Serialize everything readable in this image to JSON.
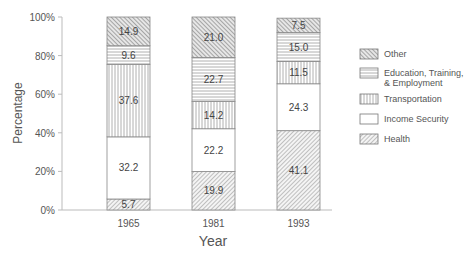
{
  "chart_data": {
    "type": "bar",
    "stacked": true,
    "title": "",
    "xlabel": "Year",
    "ylabel": "Percentage",
    "ylim": [
      0,
      100
    ],
    "yticks": [
      "0%",
      "20%",
      "40%",
      "60%",
      "80%",
      "100%"
    ],
    "categories": [
      "1965",
      "1981",
      "1993"
    ],
    "series": [
      {
        "name": "Health",
        "pattern": "diagonal-fine",
        "values": [
          5.7,
          19.9,
          41.1
        ]
      },
      {
        "name": "Income Security",
        "pattern": "blank",
        "values": [
          32.2,
          22.2,
          24.3
        ]
      },
      {
        "name": "Transportation",
        "pattern": "vertical-lines",
        "values": [
          37.6,
          14.2,
          11.5
        ]
      },
      {
        "name": "Education, Training, & Employment",
        "pattern": "horizontal-lines",
        "values": [
          9.6,
          22.7,
          15.0
        ]
      },
      {
        "name": "Other",
        "pattern": "crosshatch",
        "values": [
          14.9,
          21.0,
          7.5
        ]
      }
    ],
    "legend": {
      "position": "right",
      "entries": [
        "Other",
        "Education, Training, & Employment",
        "Transportation",
        "Income Security",
        "Health"
      ]
    },
    "grid": false
  },
  "legend_labels": {
    "other": "Other",
    "education_line1": "Education, Training,",
    "education_line2": "& Employment",
    "transportation": "Transportation",
    "income": "Income Security",
    "health": "Health"
  }
}
